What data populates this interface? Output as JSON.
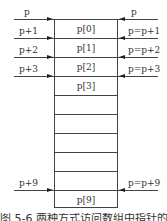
{
  "diagram": {
    "cells": [
      {
        "index": 0,
        "label": "p[0]"
      },
      {
        "index": 1,
        "label": "p[1]"
      },
      {
        "index": 2,
        "label": "p[2]"
      },
      {
        "index": 3,
        "label": "p[3]"
      },
      {
        "index": 4,
        "label": ""
      },
      {
        "index": 5,
        "label": ""
      },
      {
        "index": 6,
        "label": ""
      },
      {
        "index": 7,
        "label": ""
      },
      {
        "index": 8,
        "label": ""
      },
      {
        "index": 9,
        "label": "p[9]"
      }
    ],
    "left_pointers": [
      {
        "label": "p",
        "row": 0
      },
      {
        "label": "p+1",
        "row": 1
      },
      {
        "label": "p+2",
        "row": 2
      },
      {
        "label": "p+3",
        "row": 3
      },
      {
        "label": "p+9",
        "row": 9
      }
    ],
    "right_pointers": [
      {
        "label": "p",
        "row": 0
      },
      {
        "label": "p=p+1",
        "row": 1
      },
      {
        "label": "p=p+2",
        "row": 2
      },
      {
        "label": "p=p+3",
        "row": 3
      },
      {
        "label": "p=p+9",
        "row": 9
      }
    ],
    "caption": "图 5-6  两种方式访问数组中指针的元素"
  }
}
